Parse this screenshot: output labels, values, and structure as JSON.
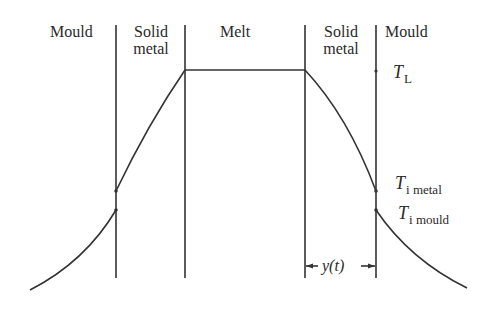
{
  "diagram": {
    "regions": [
      {
        "id": "mould-left",
        "label": "Mould"
      },
      {
        "id": "solid-left",
        "label_line1": "Solid",
        "label_line2": "metal"
      },
      {
        "id": "melt",
        "label": "Melt"
      },
      {
        "id": "solid-right",
        "label_line1": "Solid",
        "label_line2": "metal"
      },
      {
        "id": "mould-right",
        "label": "Mould"
      }
    ],
    "temperature_labels": {
      "liquidus": {
        "symbol": "T",
        "subscript": "L"
      },
      "interface_metal": {
        "symbol": "T",
        "subscript": "i metal"
      },
      "interface_mould": {
        "symbol": "T",
        "subscript": "i mould"
      }
    },
    "dimension": {
      "label": "y(t)",
      "description": "thickness of solidified shell"
    },
    "colors": {
      "line": "#333333",
      "text": "#2a2a2a",
      "background": "#ffffff"
    }
  }
}
